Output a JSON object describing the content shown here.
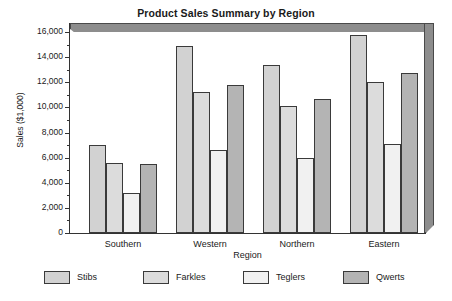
{
  "chart_data": {
    "type": "bar",
    "title": "Product Sales Summary by Region",
    "xlabel": "Region",
    "ylabel": "Sales ($1,000)",
    "categories": [
      "Southern",
      "Western",
      "Northern",
      "Eastern"
    ],
    "series": [
      {
        "name": "Stibs",
        "values": [
          7000,
          14900,
          13400,
          15800
        ],
        "color": "#d2d2d2"
      },
      {
        "name": "Farkles",
        "values": [
          5600,
          11200,
          10100,
          12000
        ],
        "color": "#dcdcdc"
      },
      {
        "name": "Teglers",
        "values": [
          3200,
          6600,
          6000,
          7100
        ],
        "color": "#f1f1f1"
      },
      {
        "name": "Qwerts",
        "values": [
          5500,
          11800,
          10700,
          12700
        ],
        "color": "#b4b4b4"
      }
    ],
    "ylim": [
      0,
      16000
    ],
    "ytick_values": [
      0,
      2000,
      4000,
      6000,
      8000,
      10000,
      12000,
      14000,
      16000
    ],
    "ytick_labels": [
      "0",
      "2,000",
      "4,000",
      "6,000",
      "8,000",
      "10,000",
      "12,000",
      "14,000",
      "16,000"
    ],
    "yminor_values": [
      1000,
      3000,
      5000,
      7000,
      9000,
      11000,
      13000,
      15000
    ],
    "grid": false,
    "legend_position": "bottom",
    "style": "3d-slab-backdrop"
  }
}
